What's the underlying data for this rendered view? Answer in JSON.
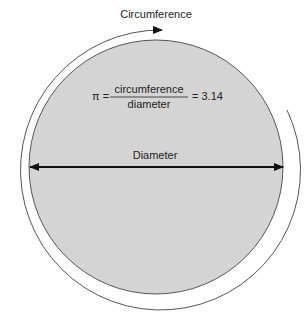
{
  "diagram": {
    "title": "Circumference",
    "formula": {
      "lhs": "π =",
      "numerator": "circumference",
      "denominator": "diameter",
      "rhs": "= 3.14"
    },
    "diameter_label": "Diameter",
    "colors": {
      "circle_fill": "#d4d4d4",
      "circle_stroke": "#555555",
      "arc_stroke": "#555555",
      "arrow": "#111111"
    }
  }
}
